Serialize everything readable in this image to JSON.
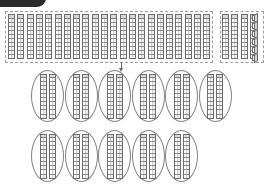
{
  "page": {
    "background_color": "#ffffff",
    "width": 265,
    "height": 185
  },
  "banner": {
    "label": "",
    "color": "#2b2b2b"
  },
  "colors": {
    "rod_fill": "#f2f3f2",
    "rod_stroke": "#6e6e6e",
    "dashed_group_stroke": "#9aa39a",
    "oval_stroke": "#7d8a7d",
    "arrow": "#6b6b6b",
    "cube_fill": "#f4f5f4"
  },
  "chart_data": {
    "type": "table",
    "xlabel": "",
    "ylabel": "",
    "categories": [
      "source-group-main",
      "source-group-right",
      "ring-row-1",
      "ring-row-2"
    ],
    "values": [
      22,
      4,
      6,
      5
    ]
  },
  "source_groups": [
    {
      "name": "main-tens-group",
      "shape": "dashed-rectangle",
      "rod_count": 22,
      "cube_count": 0,
      "x": 5,
      "y": 11,
      "width": 208,
      "height": 52,
      "rod_width": 7,
      "rod_height": 45,
      "rod_gap": 9.3,
      "rod_start_x": 8,
      "rod_y": 14,
      "segments_per_rod": 10
    },
    {
      "name": "secondary-tens-and-ones-group",
      "shape": "dashed-rectangle",
      "rod_count": 4,
      "cube_count": 6,
      "x": 220,
      "y": 11,
      "width": 44,
      "height": 52,
      "rod_width": 7,
      "rod_height": 45,
      "rod_gap": 9.3,
      "rod_start_x": 222,
      "rod_y": 14,
      "segments_per_rod": 10,
      "cube_start_x": 252,
      "cube_start_y": 15,
      "cube_gap_y": 8
    }
  ],
  "arrow": {
    "name": "downward-arrow",
    "x": 119,
    "y": 62,
    "direction": "down",
    "length": 10
  },
  "ring_rows": [
    {
      "name": "ring-row-1",
      "count": 6,
      "rods_per_ring": 2,
      "y": 70,
      "oval_width": 33,
      "oval_height": 52,
      "start_x": 31,
      "step_x": 33.5,
      "rod_width": 7,
      "rod_height": 45,
      "rod_gap": 2,
      "segments_per_rod": 10
    },
    {
      "name": "ring-row-2",
      "count": 5,
      "rods_per_ring": 2,
      "y": 130,
      "oval_width": 33,
      "oval_height": 52,
      "start_x": 31,
      "step_x": 33.5,
      "rod_width": 7,
      "rod_height": 45,
      "rod_gap": 2,
      "segments_per_rod": 10
    }
  ]
}
